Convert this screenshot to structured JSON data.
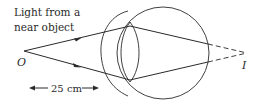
{
  "diagram": {
    "title_line1": "Light from a",
    "title_line2": "near object",
    "object_label": "O",
    "image_label": "I",
    "distance_label": "25 cm",
    "colors": {
      "line": "#2a2a2a",
      "background": "#ffffff"
    }
  }
}
